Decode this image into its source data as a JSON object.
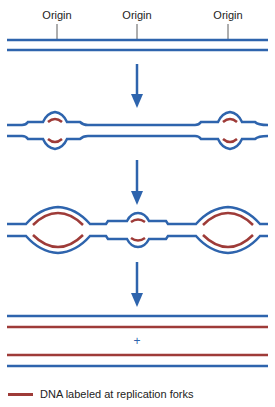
{
  "diagram": {
    "colors": {
      "parental": "#2e64ad",
      "labeled": "#9e3b38",
      "arrow": "#2e64ad"
    },
    "origins": [
      {
        "label": "Origin",
        "x": 57
      },
      {
        "label": "Origin",
        "x": 137
      },
      {
        "label": "Origin",
        "x": 228
      }
    ],
    "stages": [
      {
        "name": "unreplicated-dna",
        "description": "Parental DNA with three origins"
      },
      {
        "name": "initiation",
        "description": "Replication bubbles at two origins"
      },
      {
        "name": "elongation",
        "description": "Expanded bubbles plus third origin firing"
      },
      {
        "name": "completion",
        "description": "Two daughter duplexes"
      }
    ],
    "separator_symbol": "+"
  },
  "legend": {
    "items": [
      {
        "label": "DNA labeled at replication forks",
        "color": "#9e3b38"
      }
    ]
  }
}
